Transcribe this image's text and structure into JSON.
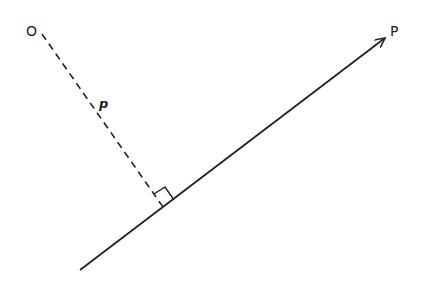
{
  "diagram": {
    "type": "geometry",
    "labels": {
      "origin": "O",
      "point": "P",
      "distance": "p"
    },
    "points": {
      "origin": [
        42,
        34
      ],
      "foot": [
        163,
        207
      ],
      "line_start": [
        80,
        270
      ],
      "line_end": [
        385,
        38
      ]
    },
    "colors": {
      "stroke": "#222222",
      "background": "#ffffff"
    }
  }
}
